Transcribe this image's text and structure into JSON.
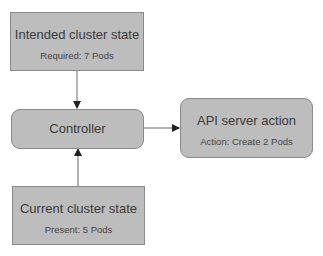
{
  "diagram": {
    "nodes": {
      "intended": {
        "title": "Intended cluster state",
        "subtitle": "Required: 7 Pods"
      },
      "controller": {
        "title": "Controller"
      },
      "api": {
        "title": "API server action",
        "subtitle": "Action: Create 2 Pods"
      },
      "current": {
        "title": "Current cluster state",
        "subtitle": "Present: 5 Pods"
      }
    },
    "edges": [
      {
        "from": "intended",
        "to": "controller"
      },
      {
        "from": "current",
        "to": "controller"
      },
      {
        "from": "controller",
        "to": "api"
      }
    ],
    "colors": {
      "box_fill": "#bdbdbd",
      "box_border": "#8a8a8a",
      "arrow": "#555555"
    }
  }
}
